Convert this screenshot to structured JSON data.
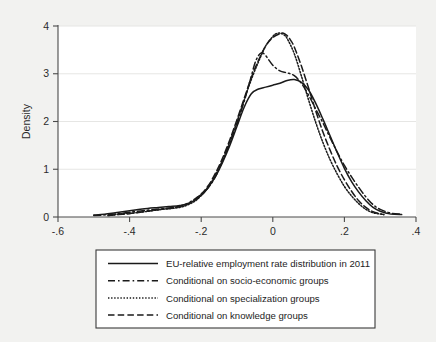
{
  "chart_data": {
    "type": "line",
    "title": "",
    "subtitle": "",
    "xlabel": "",
    "ylabel": "Density",
    "xlim": [
      -0.6,
      0.4
    ],
    "ylim": [
      0,
      4
    ],
    "grid": true,
    "grid_axis": "y",
    "legend_position": "below-plot",
    "xticks": [
      -0.6,
      -0.4,
      -0.2,
      0,
      0.2,
      0.4
    ],
    "xticklabels": [
      "-.6",
      "-.4",
      "-.2",
      "0",
      ".2",
      ".4"
    ],
    "yticks": [
      0,
      1,
      2,
      3,
      4
    ],
    "yticklabels": [
      "0",
      "1",
      "2",
      "3",
      "4"
    ],
    "series": [
      {
        "name": "EU-relative employment rate distribution in 2011",
        "style": "solid",
        "color": "#1a1a1a",
        "x": [
          -0.5,
          -0.47,
          -0.44,
          -0.41,
          -0.38,
          -0.35,
          -0.32,
          -0.29,
          -0.26,
          -0.23,
          -0.2,
          -0.18,
          -0.16,
          -0.14,
          -0.12,
          -0.1,
          -0.08,
          -0.06,
          -0.04,
          -0.02,
          0.0,
          0.02,
          0.04,
          0.06,
          0.08,
          0.1,
          0.12,
          0.14,
          0.16,
          0.18,
          0.2,
          0.22,
          0.24,
          0.26,
          0.28,
          0.3,
          0.33,
          0.36
        ],
        "y": [
          0.04,
          0.06,
          0.09,
          0.12,
          0.15,
          0.18,
          0.2,
          0.22,
          0.24,
          0.3,
          0.45,
          0.62,
          0.85,
          1.15,
          1.5,
          1.9,
          2.3,
          2.58,
          2.68,
          2.72,
          2.76,
          2.8,
          2.86,
          2.88,
          2.82,
          2.66,
          2.38,
          2.05,
          1.7,
          1.35,
          1.02,
          0.74,
          0.52,
          0.34,
          0.2,
          0.12,
          0.06,
          0.05
        ]
      },
      {
        "name": "Conditional on socio-economic groups",
        "style": "dash-dot",
        "color": "#1a1a1a",
        "x": [
          -0.5,
          -0.46,
          -0.42,
          -0.38,
          -0.34,
          -0.3,
          -0.27,
          -0.24,
          -0.21,
          -0.18,
          -0.16,
          -0.14,
          -0.12,
          -0.1,
          -0.08,
          -0.06,
          -0.05,
          -0.04,
          -0.03,
          -0.02,
          0.0,
          0.02,
          0.04,
          0.06,
          0.08,
          0.1,
          0.12,
          0.14,
          0.16,
          0.18,
          0.2,
          0.22,
          0.24,
          0.26,
          0.28,
          0.3,
          0.33,
          0.36
        ],
        "y": [
          0.03,
          0.05,
          0.08,
          0.12,
          0.15,
          0.18,
          0.21,
          0.28,
          0.42,
          0.62,
          0.85,
          1.18,
          1.55,
          1.95,
          2.42,
          2.95,
          3.22,
          3.38,
          3.44,
          3.38,
          3.18,
          3.06,
          3.02,
          2.96,
          2.8,
          2.55,
          2.26,
          1.97,
          1.66,
          1.36,
          1.08,
          0.84,
          0.62,
          0.42,
          0.26,
          0.16,
          0.08,
          0.06
        ]
      },
      {
        "name": "Conditional on specialization groups",
        "style": "dotted",
        "color": "#1a1a1a",
        "x": [
          -0.46,
          -0.43,
          -0.4,
          -0.37,
          -0.34,
          -0.31,
          -0.28,
          -0.25,
          -0.22,
          -0.2,
          -0.18,
          -0.16,
          -0.14,
          -0.12,
          -0.1,
          -0.08,
          -0.06,
          -0.04,
          -0.02,
          0.0,
          0.01,
          0.02,
          0.03,
          0.04,
          0.06,
          0.08,
          0.1,
          0.12,
          0.14,
          0.16,
          0.18,
          0.2,
          0.22,
          0.24,
          0.26,
          0.28,
          0.31
        ],
        "y": [
          0.03,
          0.06,
          0.08,
          0.1,
          0.13,
          0.16,
          0.18,
          0.22,
          0.32,
          0.45,
          0.63,
          0.88,
          1.2,
          1.58,
          2.0,
          2.45,
          2.88,
          3.25,
          3.58,
          3.78,
          3.84,
          3.85,
          3.82,
          3.74,
          3.42,
          2.95,
          2.45,
          1.98,
          1.56,
          1.2,
          0.9,
          0.64,
          0.44,
          0.28,
          0.16,
          0.09,
          0.05
        ]
      },
      {
        "name": "Conditional on knowledge groups",
        "style": "dashed",
        "color": "#1a1a1a",
        "x": [
          -0.46,
          -0.43,
          -0.4,
          -0.37,
          -0.34,
          -0.31,
          -0.28,
          -0.25,
          -0.22,
          -0.2,
          -0.18,
          -0.16,
          -0.14,
          -0.12,
          -0.1,
          -0.08,
          -0.06,
          -0.04,
          -0.02,
          0.0,
          0.02,
          0.03,
          0.04,
          0.05,
          0.06,
          0.08,
          0.1,
          0.12,
          0.14,
          0.16,
          0.18,
          0.2,
          0.22,
          0.24,
          0.26,
          0.28,
          0.31
        ],
        "y": [
          0.03,
          0.05,
          0.07,
          0.1,
          0.13,
          0.16,
          0.19,
          0.24,
          0.34,
          0.48,
          0.66,
          0.92,
          1.24,
          1.62,
          2.04,
          2.48,
          2.92,
          3.28,
          3.58,
          3.76,
          3.84,
          3.85,
          3.8,
          3.7,
          3.56,
          3.16,
          2.7,
          2.22,
          1.78,
          1.4,
          1.06,
          0.78,
          0.54,
          0.34,
          0.2,
          0.11,
          0.05
        ]
      }
    ]
  },
  "legend": {
    "items": [
      {
        "label": "EU-relative employment rate distribution in 2011",
        "style": "solid"
      },
      {
        "label": "Conditional on socio-economic groups",
        "style": "dash-dot"
      },
      {
        "label": "Conditional on specialization groups",
        "style": "dotted"
      },
      {
        "label": "Conditional on knowledge groups",
        "style": "dashed"
      }
    ]
  },
  "axes": {
    "y_title": "Density"
  }
}
